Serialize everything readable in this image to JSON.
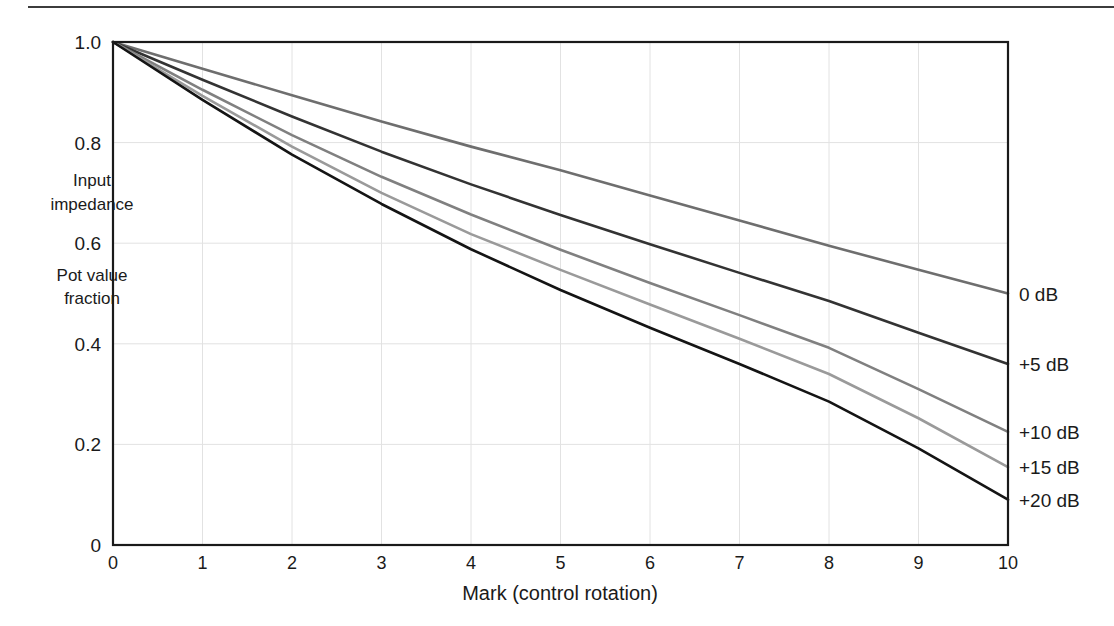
{
  "figure": {
    "separator_visible": true
  },
  "chart_data": {
    "type": "line",
    "title": "",
    "subtitle": "",
    "xlabel": "Mark  (control rotation)",
    "ylabel": "",
    "ylabel_notes": [
      "Input",
      "impedance",
      "Pot value",
      "fraction"
    ],
    "xlim": [
      0,
      10
    ],
    "ylim": [
      0,
      1.0
    ],
    "grid": true,
    "legend_position": "right-of-plot-inline",
    "x_ticks": [
      "0",
      "1",
      "2",
      "3",
      "4",
      "5",
      "6",
      "7",
      "8",
      "9",
      "10"
    ],
    "x_tick_values": [
      0,
      1,
      2,
      3,
      4,
      5,
      6,
      7,
      8,
      9,
      10
    ],
    "y_ticks": [
      "0",
      "0.2",
      "0.4",
      "0.6",
      "0.8",
      "1.0"
    ],
    "y_tick_values": [
      0,
      0.2,
      0.4,
      0.6,
      0.8,
      1.0
    ],
    "x": [
      0,
      1,
      2,
      3,
      4,
      5,
      6,
      7,
      8,
      9,
      10
    ],
    "series": [
      {
        "name": "0 dB",
        "color": "#6e6e6e",
        "values": [
          1.0,
          0.947,
          0.894,
          0.842,
          0.792,
          0.745,
          0.695,
          0.645,
          0.595,
          0.547,
          0.5
        ]
      },
      {
        "name": "+5 dB",
        "color": "#333333",
        "values": [
          1.0,
          0.925,
          0.852,
          0.782,
          0.717,
          0.656,
          0.598,
          0.541,
          0.485,
          0.422,
          0.36
        ]
      },
      {
        "name": "+10 dB",
        "color": "#808080",
        "values": [
          1.0,
          0.905,
          0.815,
          0.732,
          0.657,
          0.587,
          0.521,
          0.457,
          0.392,
          0.31,
          0.225
        ]
      },
      {
        "name": "+15 dB",
        "color": "#9a9a9a",
        "values": [
          1.0,
          0.893,
          0.792,
          0.7,
          0.618,
          0.547,
          0.478,
          0.41,
          0.34,
          0.252,
          0.155
        ]
      },
      {
        "name": "+20 dB",
        "color": "#141414",
        "values": [
          1.0,
          0.885,
          0.776,
          0.678,
          0.588,
          0.507,
          0.432,
          0.36,
          0.285,
          0.192,
          0.09
        ]
      }
    ],
    "annotations": [
      {
        "text": "Input",
        "x_px": 92,
        "y_px": 186
      },
      {
        "text": "impedance",
        "x_px": 92,
        "y_px": 210
      },
      {
        "text": "Pot value",
        "x_px": 92,
        "y_px": 281
      },
      {
        "text": "fraction",
        "x_px": 92,
        "y_px": 304
      }
    ]
  }
}
